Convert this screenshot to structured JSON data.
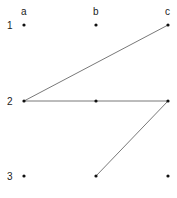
{
  "diagram": {
    "columns": [
      {
        "label": "a",
        "x": 24
      },
      {
        "label": "b",
        "x": 96
      },
      {
        "label": "c",
        "x": 168
      }
    ],
    "rows": [
      {
        "label": "1",
        "y": 25
      },
      {
        "label": "2",
        "y": 101
      },
      {
        "label": "3",
        "y": 176
      }
    ],
    "edges": [
      {
        "from": "2a",
        "to": "1c"
      },
      {
        "from": "2a",
        "to": "2c"
      },
      {
        "from": "2c",
        "to": "3b"
      }
    ],
    "colors": {
      "line": "#555555",
      "dot": "#111111"
    }
  }
}
